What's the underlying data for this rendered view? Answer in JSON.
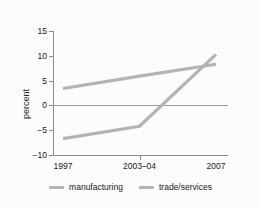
{
  "chart_data": {
    "type": "line",
    "title": "",
    "xlabel": "",
    "ylabel": "percent",
    "categories": [
      "1997",
      "2003–04",
      "2007"
    ],
    "x": [
      0,
      1,
      2
    ],
    "ylim": [
      -10,
      15
    ],
    "yticks": [
      15,
      10,
      5,
      0,
      -5,
      -10
    ],
    "ytick_labels": [
      "15",
      "10",
      "5",
      "0",
      "−5",
      "−10"
    ],
    "grid": false,
    "zero_line": true,
    "legend_position": "bottom",
    "series": [
      {
        "name": "manufacturing",
        "color": "#b3b3b3",
        "values": [
          3.4,
          5.9,
          8.3
        ]
      },
      {
        "name": "trade/services",
        "color": "#b3b3b3",
        "values": [
          -6.7,
          -4.2,
          10.3
        ]
      }
    ]
  },
  "legend": {
    "items": [
      {
        "label": "manufacturing",
        "swatch": "line-swatch"
      },
      {
        "label": "trade/services",
        "swatch": "line-swatch"
      }
    ]
  },
  "colors": {
    "line": "#b3b3b3",
    "axis": "#8a8a8a",
    "zero": "#9a9a9a",
    "text": "#1a1a1a",
    "background": "#fcfcfc"
  }
}
